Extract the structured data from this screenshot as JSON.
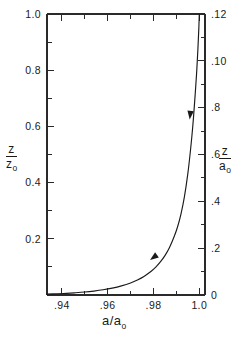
{
  "figure": {
    "background_color": "#ffffff",
    "ink_color": "#1a1a1a"
  },
  "chart_data": {
    "type": "line",
    "title": "",
    "subtitle": "",
    "xlabel": "a/a₀",
    "ylabel_left": "z/z₀",
    "ylabel_right": "z/a₀",
    "xlim": [
      0.9335,
      1.0025
    ],
    "ylim_left": [
      0.0,
      1.0
    ],
    "ylim_right": [
      0.0,
      0.12
    ],
    "grid": false,
    "legend": null,
    "x_ticklabels": [
      ".94",
      ".96",
      ".98",
      "1.0"
    ],
    "x_tickvalues": [
      0.94,
      0.96,
      0.98,
      1.0
    ],
    "x_minor_tickvalues": [
      0.95,
      0.97,
      0.99
    ],
    "y_left_ticklabels": [
      "0.2",
      "0.4",
      "0.6",
      "0.8",
      "1.0"
    ],
    "y_left_tickvalues": [
      0.2,
      0.4,
      0.6,
      0.8,
      1.0
    ],
    "y_left_minor_tickvalues": [
      0.1,
      0.3,
      0.5,
      0.7,
      0.9
    ],
    "y_right_ticklabels": [
      "0",
      ".2",
      ".4",
      ".6",
      ".8",
      ".10",
      ".12"
    ],
    "y_right_tickvalues": [
      0.0,
      0.02,
      0.04,
      0.06,
      0.08,
      0.1,
      0.12
    ],
    "y_right_minor_tickvalues": [
      0.01,
      0.03,
      0.05,
      0.07,
      0.09,
      0.11
    ],
    "series": [
      {
        "name": "z/z0 vs a/a0",
        "x": [
          0.9335,
          0.938,
          0.942,
          0.946,
          0.95,
          0.954,
          0.958,
          0.962,
          0.966,
          0.97,
          0.973,
          0.976,
          0.979,
          0.981,
          0.983,
          0.985,
          0.987,
          0.989,
          0.9905,
          0.992,
          0.9935,
          0.995,
          0.9962,
          0.9972,
          0.998,
          0.9988,
          0.9994,
          0.9998,
          1.0
        ],
        "y": [
          0.003,
          0.0045,
          0.006,
          0.008,
          0.0105,
          0.014,
          0.0185,
          0.0245,
          0.0325,
          0.043,
          0.0535,
          0.067,
          0.0845,
          0.099,
          0.1175,
          0.14,
          0.169,
          0.207,
          0.242,
          0.288,
          0.349,
          0.432,
          0.518,
          0.604,
          0.69,
          0.785,
          0.875,
          0.948,
          1.0
        ]
      }
    ],
    "annotations": [
      {
        "name": "direction-arrow-upper",
        "x": 0.9958,
        "y": 0.625,
        "direction": "down-left"
      },
      {
        "name": "direction-arrow-lower",
        "x": 0.9785,
        "y": 0.125,
        "direction": "down-left"
      }
    ]
  }
}
